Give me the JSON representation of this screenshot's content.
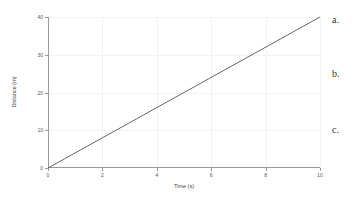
{
  "chart_data": {
    "type": "line",
    "title": "",
    "xlabel": "Time (s)",
    "ylabel": "Distance (m)",
    "xlim": [
      0,
      10
    ],
    "ylim": [
      0,
      40
    ],
    "xticks": [
      0,
      2,
      4,
      6,
      8,
      10
    ],
    "yticks": [
      0,
      10,
      20,
      30,
      40
    ],
    "xtick_labels": [
      "0",
      "2",
      "4",
      "6",
      "8",
      "10"
    ],
    "ytick_labels": [
      "0",
      "10",
      "20",
      "30",
      "40"
    ],
    "grid": true,
    "legend": "none",
    "series": [
      {
        "name": "distance",
        "x": [
          0,
          10
        ],
        "y": [
          0,
          40
        ],
        "color": "#555555",
        "slope": 4
      }
    ]
  },
  "choices": {
    "a": "a.",
    "b": "b.",
    "c": "c."
  },
  "colors": {
    "background": "#ffffff",
    "axis": "#9a9a9a",
    "grid": "#f2f2f2",
    "line": "#555555",
    "text": "#444444"
  }
}
